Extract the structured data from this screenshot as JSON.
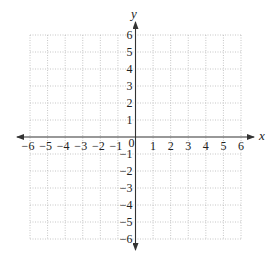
{
  "chart_data": {
    "type": "scatter",
    "title": "",
    "xlabel": "x",
    "ylabel": "y",
    "xlim": [
      -6,
      6
    ],
    "ylim": [
      -6,
      6
    ],
    "grid": true,
    "grid_style": "dotted",
    "x_ticks": [
      -6,
      -5,
      -4,
      -3,
      -2,
      -1,
      0,
      1,
      2,
      3,
      4,
      5,
      6
    ],
    "y_ticks": [
      -6,
      -5,
      -4,
      -3,
      -2,
      -1,
      1,
      2,
      3,
      4,
      5,
      6
    ],
    "x_tick_labels": [
      "−6",
      "−5",
      "−4",
      "−3",
      "−2",
      "−1",
      "0",
      "1",
      "2",
      "3",
      "4",
      "5",
      "6"
    ],
    "y_tick_labels": [
      "−6",
      "−5",
      "−4",
      "−3",
      "−2",
      "−1",
      "1",
      "2",
      "3",
      "4",
      "5",
      "6"
    ],
    "series": [],
    "arrows": {
      "x_axis": "both",
      "y_axis": "both"
    },
    "legend": null
  },
  "colors": {
    "axis": "#333333",
    "grid": "#b8b8b8",
    "text": "#222222"
  }
}
